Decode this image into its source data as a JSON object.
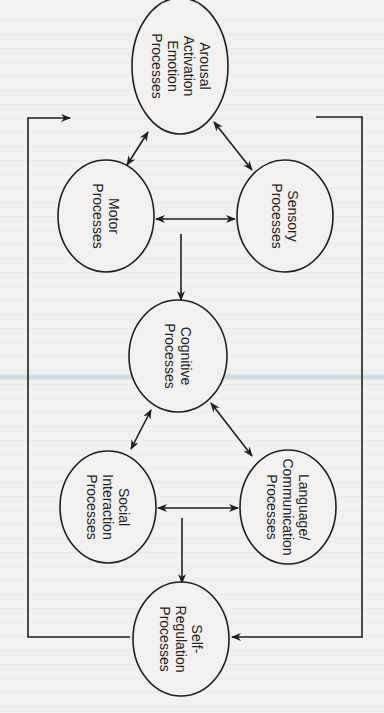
{
  "diagram": {
    "orientation": "rotated-90-clockwise",
    "nodes": [
      {
        "id": "arousal",
        "lines": [
          "Arousal",
          "Activation",
          "Emotion",
          "Processes"
        ]
      },
      {
        "id": "motor",
        "lines": [
          "Motor",
          "Processes"
        ]
      },
      {
        "id": "sensory",
        "lines": [
          "Sensory",
          "Processes"
        ]
      },
      {
        "id": "cognitive",
        "lines": [
          "Cognitive",
          "Processes"
        ]
      },
      {
        "id": "social",
        "lines": [
          "Social",
          "Interaction",
          "Processes"
        ]
      },
      {
        "id": "language",
        "lines": [
          "Language/",
          "Communication",
          "Processes"
        ]
      },
      {
        "id": "selfreg",
        "lines": [
          "Self-",
          "Regulation",
          "Processes"
        ]
      }
    ],
    "edges": [
      {
        "from": "arousal",
        "to": "motor",
        "type": "bidirectional"
      },
      {
        "from": "arousal",
        "to": "sensory",
        "type": "bidirectional"
      },
      {
        "from": "motor",
        "to": "sensory",
        "type": "bidirectional"
      },
      {
        "from": "motor-sensory",
        "to": "cognitive",
        "type": "directed"
      },
      {
        "from": "cognitive",
        "to": "social",
        "type": "bidirectional"
      },
      {
        "from": "cognitive",
        "to": "language",
        "type": "bidirectional"
      },
      {
        "from": "social",
        "to": "language",
        "type": "bidirectional"
      },
      {
        "from": "social-language",
        "to": "selfreg",
        "type": "directed"
      },
      {
        "from": "selfreg",
        "to": "arousal",
        "type": "feedback-loop-left"
      },
      {
        "from": "arousal-right",
        "to": "selfreg",
        "type": "feedback-loop-right"
      }
    ]
  },
  "colors": {
    "ink": "#1e1e1e",
    "paper": "#f2f1ef",
    "scan_artifact": "#bcd7de"
  }
}
